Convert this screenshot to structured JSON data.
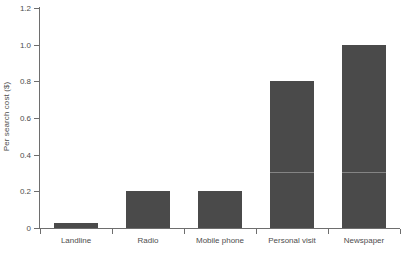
{
  "chart_data": {
    "type": "bar",
    "title": "",
    "subtitle": "",
    "xlabel": "",
    "ylabel": "Per search cost ($)",
    "categories": [
      "Landline",
      "Radio",
      "Mobile phone",
      "Personal visit",
      "Newspaper"
    ],
    "values": [
      0.03,
      0.2,
      0.2,
      0.8,
      1.0
    ],
    "series": [
      {
        "name": "Per search cost",
        "values": [
          0.03,
          0.2,
          0.2,
          0.8,
          1.0
        ]
      }
    ],
    "ylim": [
      0,
      1.2
    ],
    "yticks": [
      0,
      0.2,
      0.4,
      0.6,
      0.8,
      1.0,
      1.2
    ],
    "ytick_labels": [
      "0",
      "0.2",
      "0.4",
      "0.6",
      "0.8",
      "1.0",
      "1.2"
    ],
    "grid": false,
    "legend": false,
    "legend_position": "none",
    "bar_color": "#4a4a4a",
    "axis_color": "#6e6e6e",
    "text_color": "#4d4d4d",
    "background_color": "#ffffff",
    "annotations": []
  }
}
